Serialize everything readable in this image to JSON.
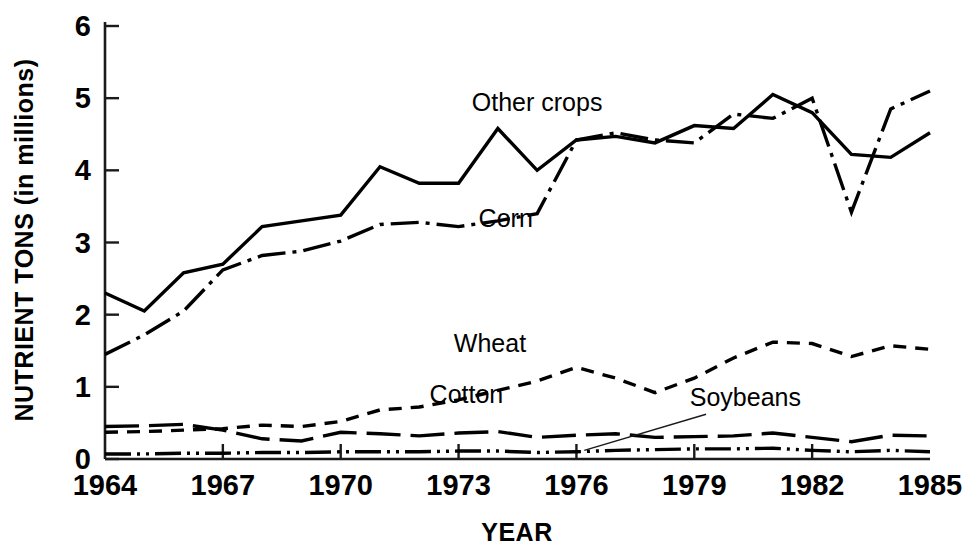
{
  "chart_data": {
    "type": "line",
    "title": "",
    "xlabel": "YEAR",
    "ylabel": "NUTRIENT TONS (in millions)",
    "xlim": [
      1964,
      1985
    ],
    "ylim": [
      0,
      6
    ],
    "grid": false,
    "legend_position": "inline-annotations",
    "xticks": [
      "1964",
      "1967",
      "1970",
      "1973",
      "1976",
      "1979",
      "1982",
      "1985"
    ],
    "xtick_values": [
      1964,
      1967,
      1970,
      1973,
      1976,
      1979,
      1982,
      1985
    ],
    "yticks": [
      "0",
      "1",
      "2",
      "3",
      "4",
      "5",
      "6"
    ],
    "ytick_values": [
      0,
      1,
      2,
      3,
      4,
      5,
      6
    ],
    "x": [
      1964,
      1965,
      1966,
      1967,
      1968,
      1969,
      1970,
      1971,
      1972,
      1973,
      1974,
      1975,
      1976,
      1977,
      1978,
      1979,
      1980,
      1981,
      1982,
      1983,
      1984,
      1985
    ],
    "series": [
      {
        "name": "Other crops",
        "style": "solid",
        "color": "#000000",
        "label_x": 1975.0,
        "label_y": 4.82,
        "values": [
          2.3,
          2.05,
          2.58,
          2.7,
          3.22,
          3.3,
          3.38,
          4.05,
          3.82,
          3.82,
          4.58,
          4.0,
          4.42,
          4.47,
          4.38,
          4.62,
          4.58,
          5.05,
          4.8,
          4.22,
          4.18,
          4.52
        ]
      },
      {
        "name": "Corn",
        "style": "dash-dot",
        "color": "#000000",
        "label_x": 1974.2,
        "label_y": 3.22,
        "values": [
          1.45,
          1.72,
          2.05,
          2.62,
          2.82,
          2.88,
          3.02,
          3.25,
          3.28,
          3.22,
          3.3,
          3.4,
          4.42,
          4.52,
          4.42,
          4.38,
          4.78,
          4.72,
          5.0,
          3.42,
          4.85,
          5.1
        ]
      },
      {
        "name": "Wheat",
        "style": "dashed",
        "color": "#000000",
        "label_x": 1973.8,
        "label_y": 1.48,
        "values": [
          0.37,
          0.38,
          0.4,
          0.42,
          0.47,
          0.45,
          0.52,
          0.68,
          0.72,
          0.82,
          0.95,
          1.08,
          1.27,
          1.12,
          0.92,
          1.12,
          1.4,
          1.62,
          1.6,
          1.42,
          1.57,
          1.52
        ]
      },
      {
        "name": "Cotton",
        "style": "long-dash",
        "color": "#000000",
        "label_x": 1973.2,
        "label_y": 0.78,
        "values": [
          0.45,
          0.46,
          0.48,
          0.4,
          0.28,
          0.25,
          0.37,
          0.35,
          0.32,
          0.36,
          0.38,
          0.3,
          0.33,
          0.35,
          0.3,
          0.31,
          0.32,
          0.36,
          0.3,
          0.24,
          0.33,
          0.32
        ]
      },
      {
        "name": "Soybeans",
        "style": "dash-dot-dot",
        "color": "#000000",
        "label_x": 1980.3,
        "label_y": 0.73,
        "values": [
          0.07,
          0.07,
          0.08,
          0.08,
          0.09,
          0.09,
          0.1,
          0.1,
          0.1,
          0.11,
          0.11,
          0.09,
          0.1,
          0.12,
          0.13,
          0.14,
          0.14,
          0.15,
          0.12,
          0.1,
          0.12,
          0.1
        ]
      }
    ],
    "annotations": [
      {
        "name": "soybeans-leader-line",
        "from_x": 1979.3,
        "from_y": 0.62,
        "to_x": 1976.2,
        "to_y": 0.12
      }
    ]
  },
  "labels": {
    "y_axis_title": "NUTRIENT TONS (in millions)",
    "x_axis_title": "YEAR"
  }
}
